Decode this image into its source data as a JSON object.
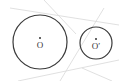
{
  "diagram": {
    "type": "two-circles-tangents",
    "colors": {
      "circle_stroke": "#3a3a3a",
      "tangent_stroke": "#d8d8d8",
      "label": "#333333",
      "background": "#ffffff"
    },
    "circles": [
      {
        "id": "O",
        "label": "O",
        "cx": 40,
        "cy": 42,
        "r": 27
      },
      {
        "id": "O_prime",
        "label": "O′",
        "cx": 96,
        "cy": 43,
        "r": 16
      }
    ],
    "tangent_lines": [
      {
        "x1": 10,
        "y1": 8,
        "x2": 119,
        "y2": 25
      },
      {
        "x1": 44,
        "y1": 0,
        "x2": 76,
        "y2": 34
      },
      {
        "x1": 104,
        "y1": 8,
        "x2": 60,
        "y2": 81
      },
      {
        "x1": 18,
        "y1": 81,
        "x2": 119,
        "y2": 60
      },
      {
        "x1": 82,
        "y1": 68,
        "x2": 112,
        "y2": 81
      }
    ]
  }
}
